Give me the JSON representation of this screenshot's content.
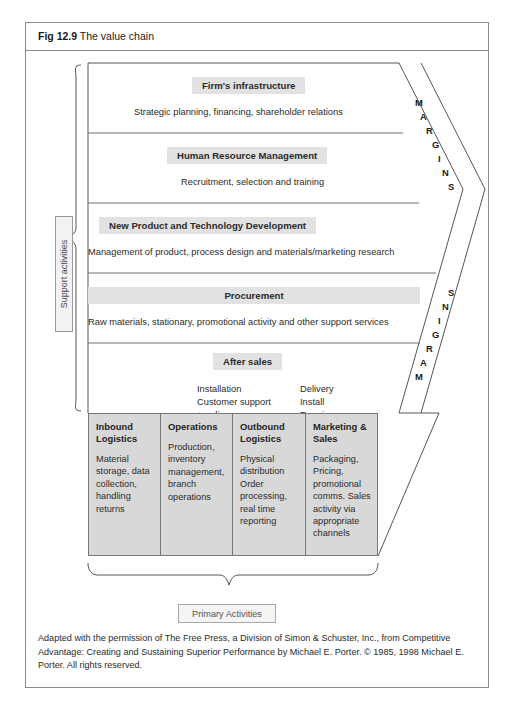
{
  "figure": {
    "number": "Fig 12.9",
    "title": "The value chain"
  },
  "labels": {
    "support_activities": "Support activities",
    "primary_activities": "Primary Activities",
    "margins_upper": "MARGINS",
    "margins_lower": "MARGINS"
  },
  "support_bands": [
    {
      "title": "Firm's infrastructure",
      "description": "Strategic planning, financing, shareholder relations"
    },
    {
      "title": "Human Resource Management",
      "description": "Recruitment, selection and training"
    },
    {
      "title": "New Product and Technology Development",
      "description": "Management of product, process design and materials/marketing research"
    },
    {
      "title": "Procurement",
      "description": "Raw materials, stationary, promotional activity and other support services"
    }
  ],
  "after_sales": {
    "title": "After sales",
    "column_left": "Installation\nCustomer support\n+ online\nrepair,\nservicing",
    "column_right": "Delivery\nInstall\nRepair\nService"
  },
  "primary_activities": [
    {
      "title": "Inbound Logistics",
      "description": "Material storage, data collection, handling returns"
    },
    {
      "title": "Operations",
      "description": "Production, inventory management, branch operations"
    },
    {
      "title": "Outbound Logistics",
      "description": "Physical distribution Order processing, real time reporting"
    },
    {
      "title": "Marketing & Sales",
      "description": "Packaging, Pricing, promotional comms. Sales activity via appropriate channels"
    }
  ],
  "attribution": "Adapted with the permission of The Free Press, a Division of Simon & Schuster, Inc., from Competitive Advantage: Creating and Sustaining Superior Performance by Michael E. Porter. © 1985, 1998 Michael E. Porter. All rights reserved.",
  "colors": {
    "band_title_highlight": "#e2e2e2",
    "primary_box_fill": "#d8d8d8",
    "frame_border": "#8a8a8a",
    "text": "#2b2b2b"
  }
}
